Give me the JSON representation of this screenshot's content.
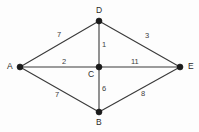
{
  "figure": {
    "background_color": "#fdfdfd",
    "node_color": "#1a1a1a",
    "edge_color": "#3a3a3a",
    "label_color": "#2b2b2b"
  },
  "nodes": [
    {
      "id": "A",
      "label": "A",
      "x": 20,
      "y": 67,
      "label_x": 7,
      "label_y": 62
    },
    {
      "id": "D",
      "label": "D",
      "x": 99,
      "y": 21,
      "label_x": 96,
      "label_y": 6
    },
    {
      "id": "C",
      "label": "C",
      "x": 99,
      "y": 67,
      "label_x": 88,
      "label_y": 70
    },
    {
      "id": "B",
      "label": "B",
      "x": 99,
      "y": 112,
      "label_x": 96,
      "label_y": 118
    },
    {
      "id": "E",
      "label": "E",
      "x": 180,
      "y": 67,
      "label_x": 188,
      "label_y": 62
    }
  ],
  "edges": [
    {
      "id": "A-D",
      "from": "A",
      "to": "D",
      "weight": "7",
      "label_x": 57,
      "label_y": 31
    },
    {
      "id": "A-C",
      "from": "A",
      "to": "C",
      "weight": "2",
      "label_x": 62,
      "label_y": 58
    },
    {
      "id": "A-B",
      "from": "A",
      "to": "B",
      "weight": "7",
      "label_x": 55,
      "label_y": 91
    },
    {
      "id": "D-C",
      "from": "D",
      "to": "C",
      "weight": "1",
      "label_x": 102,
      "label_y": 41
    },
    {
      "id": "D-E",
      "from": "D",
      "to": "E",
      "weight": "3",
      "label_x": 145,
      "label_y": 32
    },
    {
      "id": "C-B",
      "from": "C",
      "to": "B",
      "weight": "6",
      "label_x": 102,
      "label_y": 85
    },
    {
      "id": "C-E",
      "from": "C",
      "to": "E",
      "weight": "11",
      "label_x": 131,
      "label_y": 58
    },
    {
      "id": "B-E",
      "from": "B",
      "to": "E",
      "weight": "8",
      "label_x": 141,
      "label_y": 90
    }
  ],
  "chart_data": {
    "type": "diagram",
    "diagram_type": "weighted-undirected-graph",
    "title": "",
    "vertices": [
      "A",
      "D",
      "C",
      "B",
      "E"
    ],
    "edge_list": [
      {
        "source": "A",
        "target": "D",
        "weight": 7
      },
      {
        "source": "A",
        "target": "C",
        "weight": 2
      },
      {
        "source": "A",
        "target": "B",
        "weight": 7
      },
      {
        "source": "D",
        "target": "C",
        "weight": 1
      },
      {
        "source": "D",
        "target": "E",
        "weight": 3
      },
      {
        "source": "C",
        "target": "B",
        "weight": 6
      },
      {
        "source": "C",
        "target": "E",
        "weight": 11
      },
      {
        "source": "B",
        "target": "E",
        "weight": 8
      }
    ],
    "vertex_count": 5,
    "edge_count": 8,
    "directed": false,
    "legend": [],
    "annotations": []
  }
}
